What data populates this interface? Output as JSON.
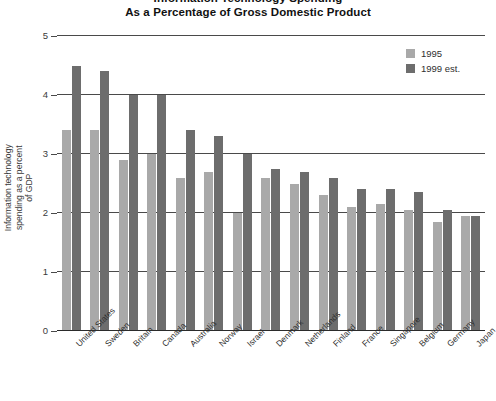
{
  "title": {
    "line1": "Information Technology Spending",
    "line2": "As a Percentage of Gross Domestic Product"
  },
  "legend": {
    "position": "top-right",
    "items": [
      {
        "label": "1995",
        "color": "#a9a9a9"
      },
      {
        "label": "1999 est.",
        "color": "#6d6d6d"
      }
    ]
  },
  "axes": {
    "ylabel": "Information technology\nspending as a percent\nof GDP",
    "yticks": [
      "5",
      "4",
      "3",
      "2",
      "1",
      "0"
    ],
    "ymin": 0,
    "ymax": 5
  },
  "chart_data": {
    "type": "bar",
    "title": "Information Technology Spending As a Percentage of Gross Domestic Product",
    "xlabel": "",
    "ylabel": "Information technology spending as a percent of GDP",
    "ylim": [
      0,
      5
    ],
    "ytick_values": [
      0,
      1,
      2,
      3,
      4,
      5
    ],
    "grid": true,
    "legend_position": "top-right",
    "categories": [
      "United States",
      "Sweden",
      "Britain",
      "Canada",
      "Australia",
      "Norway",
      "Israel",
      "Denmark",
      "Netherlands",
      "Finland",
      "France",
      "Singapore",
      "Belgium",
      "Germany",
      "Japan"
    ],
    "series": [
      {
        "name": "1995",
        "color": "#a9a9a9",
        "values": [
          3.4,
          3.4,
          2.9,
          3.0,
          2.6,
          2.7,
          2.0,
          2.6,
          2.5,
          2.3,
          2.1,
          2.15,
          2.05,
          1.85,
          1.95
        ]
      },
      {
        "name": "1999 est.",
        "color": "#6d6d6d",
        "values": [
          4.5,
          4.4,
          4.0,
          4.0,
          3.4,
          3.3,
          3.0,
          2.75,
          2.7,
          2.6,
          2.4,
          2.4,
          2.35,
          2.05,
          1.95
        ]
      }
    ]
  }
}
